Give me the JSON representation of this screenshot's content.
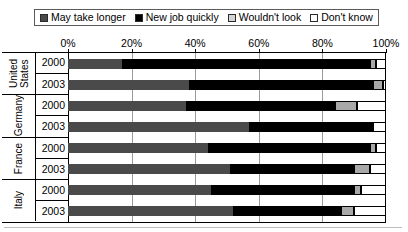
{
  "chart_data": {
    "type": "bar",
    "orientation": "horizontal",
    "stacked": true,
    "title": "",
    "xlabel": "",
    "ylabel": "",
    "xlim": [
      0,
      100
    ],
    "xticks": [
      0,
      20,
      40,
      60,
      80,
      100
    ],
    "xtick_labels": [
      "0%",
      "20%",
      "40%",
      "60%",
      "80%",
      "100%"
    ],
    "grid": true,
    "legend_position": "top",
    "categories": [
      "United States 2000",
      "United States 2003",
      "Germany 2000",
      "Germany 2003",
      "France 2000",
      "France 2003",
      "Italy 2000",
      "Italy 2003"
    ],
    "groups": [
      {
        "country": "United States",
        "years": [
          "2000",
          "2003"
        ]
      },
      {
        "country": "Germany",
        "years": [
          "2000",
          "2003"
        ]
      },
      {
        "country": "France",
        "years": [
          "2000",
          "2003"
        ]
      },
      {
        "country": "Italy",
        "years": [
          "2000",
          "2003"
        ]
      }
    ],
    "series": [
      {
        "name": "May take longer",
        "color": "#4a4a4a",
        "values": [
          17,
          38,
          37,
          57,
          44,
          51,
          45,
          52
        ]
      },
      {
        "name": "New job quickly",
        "color": "#000000",
        "values": [
          78,
          58,
          47,
          39,
          51,
          39,
          45,
          34
        ]
      },
      {
        "name": "Wouldn't look",
        "color": "#a8a8a8",
        "values": [
          2,
          3,
          7,
          0,
          2,
          5,
          2,
          4
        ]
      },
      {
        "name": "Don't know",
        "color": "#ffffff",
        "values": [
          3,
          1,
          9,
          4,
          3,
          5,
          8,
          10
        ]
      }
    ],
    "rows": [
      {
        "label": "United States 2000",
        "country": "United States",
        "year": "2000",
        "segments": [
          17,
          78,
          2,
          3
        ]
      },
      {
        "label": "United States 2003",
        "country": "United States",
        "year": "2003",
        "segments": [
          38,
          58,
          3,
          1
        ]
      },
      {
        "label": "Germany 2000",
        "country": "Germany",
        "year": "2000",
        "segments": [
          37,
          47,
          7,
          9
        ]
      },
      {
        "label": "Germany 2003",
        "country": "Germany",
        "year": "2003",
        "segments": [
          57,
          39,
          0,
          4
        ]
      },
      {
        "label": "France 2000",
        "country": "France",
        "year": "2000",
        "segments": [
          44,
          51,
          2,
          3
        ]
      },
      {
        "label": "France 2003",
        "country": "France",
        "year": "2003",
        "segments": [
          51,
          39,
          5,
          5
        ]
      },
      {
        "label": "Italy 2000",
        "country": "Italy",
        "year": "2000",
        "segments": [
          45,
          45,
          2,
          8
        ]
      },
      {
        "label": "Italy 2003",
        "country": "Italy",
        "year": "2003",
        "segments": [
          52,
          34,
          4,
          10
        ]
      }
    ]
  },
  "legend": {
    "items": [
      {
        "label": "May take longer",
        "color": "#4a4a4a"
      },
      {
        "label": "New job quickly",
        "color": "#000000"
      },
      {
        "label": "Wouldn't look",
        "color": "#d4d4d4"
      },
      {
        "label": "Don't know",
        "color": "#ffffff"
      }
    ]
  },
  "axis": {
    "tick_labels": [
      "0%",
      "20%",
      "40%",
      "60%",
      "80%",
      "100%"
    ]
  }
}
